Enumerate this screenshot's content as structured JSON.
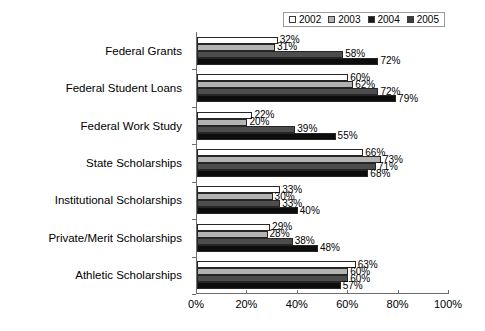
{
  "chart_data": {
    "type": "bar",
    "orientation": "horizontal",
    "title": "",
    "xlabel": "",
    "ylabel": "",
    "xlim": [
      0,
      100
    ],
    "xticks": [
      "0%",
      "20%",
      "40%",
      "60%",
      "80%",
      "100%"
    ],
    "xtick_values": [
      0,
      20,
      40,
      60,
      80,
      100
    ],
    "grid": false,
    "legend_position": "top-right",
    "value_suffix": "%",
    "categories": [
      "Federal Grants",
      "Federal Student Loans",
      "Federal Work Study",
      "State Scholarships",
      "Institutional Scholarships",
      "Private/Merit Scholarships",
      "Athletic Scholarships"
    ],
    "series": [
      {
        "name": "2002",
        "color": "#ffffff",
        "values": [
          32,
          60,
          22,
          66,
          33,
          29,
          63
        ],
        "labels": [
          "32%",
          "60%",
          "22%",
          "66%",
          "33%",
          "29%",
          "63%"
        ]
      },
      {
        "name": "2003",
        "color": "#b3b3b3",
        "values": [
          31,
          62,
          20,
          73,
          30,
          28,
          60
        ],
        "labels": [
          "31%",
          "62%",
          "20%",
          "73%",
          "30%",
          "28%",
          "60%"
        ]
      },
      {
        "name": "2004",
        "color": "#4d4d4d",
        "values": [
          58,
          72,
          39,
          71,
          33,
          38,
          60
        ],
        "labels": [
          "58%",
          "72%",
          "39%",
          "71%",
          "33%",
          "38%",
          "60%"
        ]
      },
      {
        "name": "2005",
        "color": "#0d0d0d",
        "values": [
          72,
          79,
          55,
          68,
          40,
          48,
          57
        ],
        "labels": [
          "72%",
          "79%",
          "55%",
          "68%",
          "40%",
          "48%",
          "57%"
        ]
      }
    ]
  },
  "legend": {
    "items": [
      {
        "label": "2002",
        "color": "#ffffff"
      },
      {
        "label": "2003",
        "color": "#b3b3b3"
      },
      {
        "label": "2004",
        "color": "#1a1a1a"
      },
      {
        "label": "2005",
        "color": "#3d3d3d"
      }
    ]
  }
}
